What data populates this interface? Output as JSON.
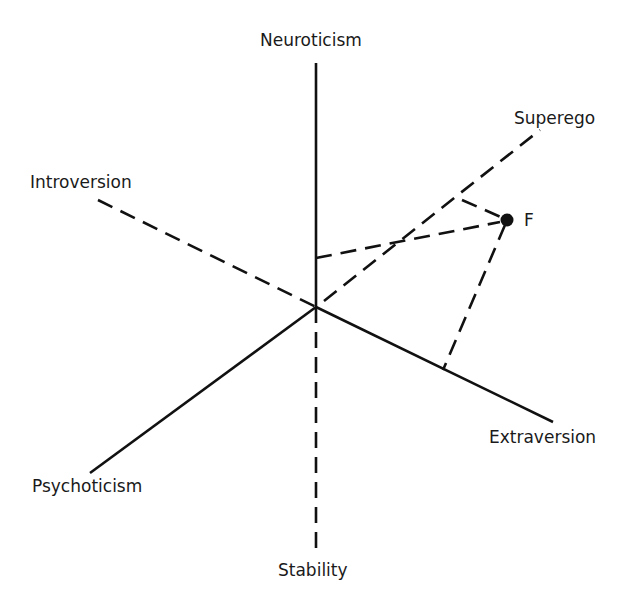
{
  "diagram": {
    "type": "personality-dimension-axes",
    "axes": {
      "neuroticism": {
        "label": "Neuroticism",
        "style": "solid"
      },
      "stability": {
        "label": "Stability",
        "style": "dashed"
      },
      "introversion": {
        "label": "Introversion",
        "style": "dashed"
      },
      "extraversion": {
        "label": "Extraversion",
        "style": "solid"
      },
      "psychoticism": {
        "label": "Psychoticism",
        "style": "solid"
      },
      "superego": {
        "label": "Superego",
        "style": "dashed"
      }
    },
    "point": {
      "label": "F"
    },
    "colors": {
      "line": "#111111",
      "text": "#1a1a1a",
      "background": "#ffffff"
    }
  }
}
